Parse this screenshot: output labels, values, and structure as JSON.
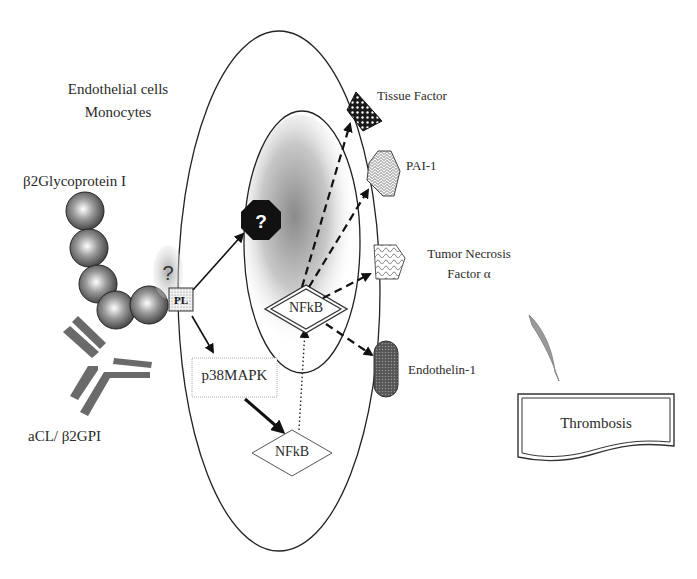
{
  "labels": {
    "cell_type_line1": "Endothelial cells",
    "cell_type_line2": "Monocytes",
    "b2gpi": "β2Glycoprotein I",
    "antibody": "aCL/ β2GPI",
    "pl": "PL",
    "question": "?",
    "unknown_factor": "?",
    "p38": "p38MAPK",
    "nfkb_cytoplasm": "NFkB",
    "nfkb_nucleus": "NFkB",
    "tissue_factor": "Tissue Factor",
    "pai1": "PAI-1",
    "tnf_line1": "Tumor Necrosis",
    "tnf_line2": "Factor α",
    "endothelin": "Endothelin-1",
    "thrombosis": "Thrombosis"
  },
  "nodes": [
    {
      "id": "b2gpi",
      "label": "β2Glycoprotein I",
      "shape": "bead-chain"
    },
    {
      "id": "antibody",
      "label": "aCL/ β2GPI",
      "shape": "Y-antibody"
    },
    {
      "id": "pl",
      "label": "PL",
      "shape": "square-stippled"
    },
    {
      "id": "receptor",
      "label": "?",
      "shape": "gray-oval"
    },
    {
      "id": "unknown",
      "label": "?",
      "shape": "black-octagon"
    },
    {
      "id": "p38",
      "label": "p38MAPK",
      "shape": "rectangle"
    },
    {
      "id": "nfkb_c",
      "label": "NFkB",
      "shape": "diamond"
    },
    {
      "id": "nfkb_n",
      "label": "NFkB",
      "shape": "double-diamond"
    },
    {
      "id": "tf",
      "label": "Tissue Factor",
      "shape": "triangle-checker"
    },
    {
      "id": "pai1",
      "label": "PAI-1",
      "shape": "hexagon-hatched"
    },
    {
      "id": "tnf",
      "label": "Tumor Necrosis Factor α",
      "shape": "pentagon-hatched"
    },
    {
      "id": "et1",
      "label": "Endothelin-1",
      "shape": "capsule-dotted"
    },
    {
      "id": "thrombosis",
      "label": "Thrombosis",
      "shape": "document-box"
    }
  ],
  "edges": [
    {
      "from": "pl",
      "to": "unknown",
      "style": "solid"
    },
    {
      "from": "pl",
      "to": "p38",
      "style": "solid"
    },
    {
      "from": "p38",
      "to": "nfkb_c",
      "style": "bold"
    },
    {
      "from": "nfkb_c",
      "to": "nfkb_n",
      "style": "dotted"
    },
    {
      "from": "nfkb_n",
      "to": "tf",
      "style": "dashed"
    },
    {
      "from": "nfkb_n",
      "to": "pai1",
      "style": "dashed"
    },
    {
      "from": "nfkb_n",
      "to": "tnf",
      "style": "dashed"
    },
    {
      "from": "nfkb_n",
      "to": "et1",
      "style": "dashed"
    }
  ]
}
